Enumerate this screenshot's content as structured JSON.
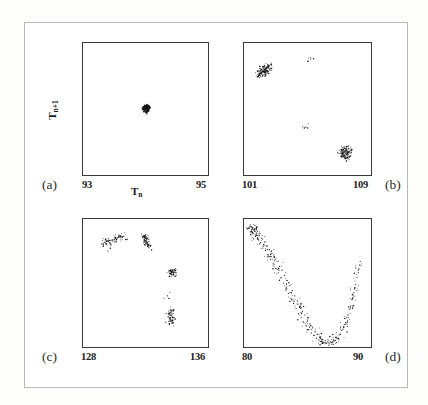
{
  "figure": {
    "title": "",
    "axis_titles": {
      "x": "T",
      "x_sub": "n",
      "y": "T",
      "y_sub": "n+1"
    }
  },
  "chart_data": [
    {
      "type": "scatter",
      "panel": "(a)",
      "title": "",
      "xlabel": "T_n",
      "ylabel": "T_n+1",
      "xlim": [
        93,
        95
      ],
      "ylim": [
        93,
        95
      ],
      "xticks": [
        "93",
        "95"
      ],
      "grid": false,
      "legend": "none",
      "annotation": "period-1 fixed point: single dense cluster",
      "points": [
        [
          94.02,
          94.0
        ],
        [
          94.0,
          94.03
        ],
        [
          94.03,
          94.01
        ],
        [
          93.99,
          93.98
        ],
        [
          94.01,
          94.04
        ],
        [
          94.04,
          94.02
        ],
        [
          93.98,
          94.01
        ],
        [
          94.02,
          93.97
        ],
        [
          94.05,
          94.03
        ],
        [
          93.97,
          94.0
        ],
        [
          94.0,
          94.05
        ],
        [
          94.03,
          93.99
        ],
        [
          93.99,
          94.02
        ],
        [
          94.06,
          94.01
        ],
        [
          94.01,
          93.96
        ],
        [
          93.96,
          93.99
        ],
        [
          94.04,
          94.06
        ],
        [
          94.02,
          94.02
        ],
        [
          94.0,
          93.99
        ],
        [
          94.01,
          94.01
        ],
        [
          94.03,
          94.04
        ],
        [
          93.98,
          93.97
        ],
        [
          94.05,
          93.98
        ],
        [
          93.97,
          94.04
        ],
        [
          94.02,
          94.05
        ],
        [
          94.0,
          94.0
        ],
        [
          94.04,
          93.97
        ],
        [
          93.99,
          94.05
        ],
        [
          94.01,
          94.0
        ],
        [
          94.03,
          94.02
        ],
        [
          94.06,
          94.04
        ],
        [
          93.95,
          94.01
        ],
        [
          94.02,
          93.95
        ],
        [
          94.0,
          94.02
        ],
        [
          94.01,
          94.03
        ],
        [
          94.04,
          94.0
        ],
        [
          93.98,
          94.03
        ],
        [
          94.03,
          93.96
        ],
        [
          94.05,
          94.05
        ],
        [
          93.99,
          93.96
        ],
        [
          94.07,
          94.02
        ],
        [
          93.96,
          94.03
        ],
        [
          94.02,
          94.07
        ],
        [
          94.01,
          93.94
        ],
        [
          94.0,
          94.01
        ]
      ]
    },
    {
      "type": "scatter",
      "panel": "(b)",
      "title": "",
      "xlabel": "T_n",
      "ylabel": "T_n+1",
      "xlim": [
        101,
        109
      ],
      "ylim": [
        101,
        109
      ],
      "xticks": [
        "101",
        "109"
      ],
      "grid": false,
      "legend": "none",
      "annotation": "period-2 orbit: two clusters, upper-left and lower-right",
      "points": [
        [
          102.1,
          107.2
        ],
        [
          102.2,
          107.3
        ],
        [
          102.3,
          107.4
        ],
        [
          102.0,
          107.1
        ],
        [
          102.4,
          107.5
        ],
        [
          102.5,
          107.5
        ],
        [
          102.15,
          107.25
        ],
        [
          102.25,
          107.35
        ],
        [
          102.35,
          107.45
        ],
        [
          101.95,
          107.05
        ],
        [
          102.45,
          107.55
        ],
        [
          102.05,
          107.15
        ],
        [
          102.6,
          107.6
        ],
        [
          101.9,
          107.0
        ],
        [
          102.55,
          107.5
        ],
        [
          102.3,
          107.2
        ],
        [
          102.1,
          107.4
        ],
        [
          102.4,
          107.3
        ],
        [
          102.2,
          107.5
        ],
        [
          102.5,
          107.3
        ],
        [
          102.0,
          107.45
        ],
        [
          102.35,
          107.1
        ],
        [
          102.7,
          107.7
        ],
        [
          101.85,
          106.95
        ],
        [
          102.25,
          107.55
        ],
        [
          102.15,
          107.0
        ],
        [
          102.45,
          107.2
        ],
        [
          102.05,
          107.35
        ],
        [
          102.55,
          107.65
        ],
        [
          102.3,
          107.6
        ],
        [
          107.3,
          102.4
        ],
        [
          107.4,
          102.3
        ],
        [
          107.2,
          102.5
        ],
        [
          107.5,
          102.2
        ],
        [
          107.35,
          102.45
        ],
        [
          107.25,
          102.35
        ],
        [
          107.45,
          102.25
        ],
        [
          107.15,
          102.55
        ],
        [
          107.55,
          102.15
        ],
        [
          107.3,
          102.2
        ],
        [
          107.4,
          102.6
        ],
        [
          107.2,
          102.3
        ],
        [
          107.5,
          102.5
        ],
        [
          107.6,
          102.4
        ],
        [
          107.1,
          102.4
        ],
        [
          107.35,
          102.6
        ],
        [
          107.45,
          102.5
        ],
        [
          107.25,
          102.15
        ],
        [
          107.55,
          102.35
        ],
        [
          107.3,
          102.7
        ],
        [
          107.4,
          102.1
        ],
        [
          107.2,
          102.65
        ],
        [
          107.5,
          102.05
        ],
        [
          107.65,
          102.45
        ],
        [
          107.05,
          102.3
        ],
        [
          107.35,
          102.05
        ],
        [
          107.15,
          102.2
        ],
        [
          107.6,
          102.6
        ],
        [
          107.45,
          102.7
        ],
        [
          107.25,
          102.45
        ],
        [
          105.2,
          108.1
        ],
        [
          104.9,
          103.9
        ]
      ]
    },
    {
      "type": "scatter",
      "panel": "(c)",
      "title": "",
      "xlabel": "T_n",
      "ylabel": "T_n+1",
      "xlim": [
        128,
        136
      ],
      "ylim": [
        128,
        136
      ],
      "xticks": [
        "128",
        "136"
      ],
      "grid": false,
      "legend": "none",
      "annotation": "period-4 orbit: four clusters arranged around an arc",
      "points": [
        [
          129.3,
          134.5
        ],
        [
          129.5,
          134.6
        ],
        [
          129.7,
          134.65
        ],
        [
          129.9,
          134.7
        ],
        [
          130.1,
          134.8
        ],
        [
          130.3,
          134.85
        ],
        [
          130.5,
          134.9
        ],
        [
          129.4,
          134.55
        ],
        [
          129.6,
          134.6
        ],
        [
          129.8,
          134.68
        ],
        [
          130.0,
          134.75
        ],
        [
          130.2,
          134.82
        ],
        [
          130.4,
          134.88
        ],
        [
          130.6,
          134.92
        ],
        [
          129.2,
          134.45
        ],
        [
          131.9,
          134.9
        ],
        [
          132.0,
          134.8
        ],
        [
          132.05,
          134.6
        ],
        [
          132.1,
          134.45
        ],
        [
          132.15,
          134.3
        ],
        [
          132.0,
          134.95
        ],
        [
          132.08,
          134.7
        ],
        [
          132.12,
          134.5
        ],
        [
          132.18,
          134.35
        ],
        [
          131.95,
          134.85
        ],
        [
          132.05,
          134.75
        ],
        [
          132.1,
          134.55
        ],
        [
          132.2,
          134.25
        ],
        [
          132.02,
          134.65
        ],
        [
          132.14,
          134.4
        ],
        [
          133.6,
          132.6
        ],
        [
          133.7,
          132.7
        ],
        [
          133.8,
          132.65
        ],
        [
          133.65,
          132.55
        ],
        [
          133.75,
          132.75
        ],
        [
          133.55,
          132.6
        ],
        [
          133.85,
          132.7
        ],
        [
          133.7,
          132.5
        ],
        [
          133.6,
          132.8
        ],
        [
          133.8,
          132.55
        ],
        [
          133.72,
          132.68
        ],
        [
          133.66,
          132.72
        ],
        [
          133.78,
          132.62
        ],
        [
          133.9,
          132.66
        ],
        [
          133.5,
          132.7
        ],
        [
          133.5,
          129.6
        ],
        [
          133.55,
          129.8
        ],
        [
          133.6,
          130.0
        ],
        [
          133.65,
          130.2
        ],
        [
          133.7,
          129.5
        ],
        [
          133.45,
          129.9
        ],
        [
          133.55,
          130.1
        ],
        [
          133.6,
          129.7
        ],
        [
          133.68,
          129.95
        ],
        [
          133.5,
          130.25
        ],
        [
          133.62,
          129.6
        ],
        [
          133.58,
          130.15
        ],
        [
          133.72,
          129.85
        ],
        [
          133.48,
          130.05
        ],
        [
          133.66,
          130.3
        ],
        [
          133.4,
          131.2
        ],
        [
          129.6,
          134.0
        ]
      ]
    },
    {
      "type": "scatter",
      "panel": "(d)",
      "title": "",
      "xlabel": "T_n",
      "ylabel": "T_n+1",
      "xlim": [
        80,
        90
      ],
      "ylim": [
        80,
        90
      ],
      "xticks": [
        "80",
        "90"
      ],
      "grid": false,
      "legend": "none",
      "annotation": "chaotic attractor: broad U-shaped (parabolic) band of points",
      "points": [
        [
          80.4,
          89.3
        ],
        [
          80.6,
          89.2
        ],
        [
          80.8,
          89.1
        ],
        [
          81.0,
          88.9
        ],
        [
          81.2,
          88.7
        ],
        [
          81.4,
          88.5
        ],
        [
          81.6,
          88.2
        ],
        [
          81.8,
          87.9
        ],
        [
          82.0,
          87.6
        ],
        [
          82.2,
          87.3
        ],
        [
          82.4,
          87.0
        ],
        [
          82.6,
          86.7
        ],
        [
          82.8,
          86.3
        ],
        [
          83.0,
          86.0
        ],
        [
          83.2,
          85.6
        ],
        [
          83.4,
          85.2
        ],
        [
          83.6,
          84.8
        ],
        [
          83.8,
          84.4
        ],
        [
          84.0,
          84.0
        ],
        [
          84.2,
          83.6
        ],
        [
          84.4,
          83.2
        ],
        [
          84.6,
          82.8
        ],
        [
          84.8,
          82.5
        ],
        [
          85.0,
          82.1
        ],
        [
          85.2,
          81.8
        ],
        [
          85.4,
          81.5
        ],
        [
          85.6,
          81.2
        ],
        [
          85.8,
          81.0
        ],
        [
          86.0,
          80.8
        ],
        [
          86.2,
          80.6
        ],
        [
          86.4,
          80.5
        ],
        [
          86.6,
          80.4
        ],
        [
          86.8,
          80.4
        ],
        [
          87.0,
          80.45
        ],
        [
          87.2,
          80.5
        ],
        [
          87.4,
          80.7
        ],
        [
          87.6,
          81.0
        ],
        [
          87.8,
          81.4
        ],
        [
          88.0,
          81.9
        ],
        [
          88.2,
          82.5
        ],
        [
          88.4,
          83.2
        ],
        [
          88.6,
          84.0
        ],
        [
          88.8,
          84.9
        ],
        [
          89.0,
          85.8
        ],
        [
          89.1,
          86.4
        ],
        [
          80.5,
          89.0
        ],
        [
          80.7,
          88.85
        ],
        [
          80.9,
          88.65
        ],
        [
          81.1,
          88.4
        ],
        [
          81.3,
          88.15
        ],
        [
          81.5,
          87.85
        ],
        [
          81.7,
          87.55
        ],
        [
          81.9,
          87.2
        ],
        [
          82.1,
          86.85
        ],
        [
          82.3,
          86.5
        ],
        [
          82.5,
          86.15
        ],
        [
          82.7,
          85.8
        ],
        [
          82.9,
          85.4
        ],
        [
          83.1,
          85.0
        ],
        [
          83.3,
          84.6
        ],
        [
          83.5,
          84.2
        ],
        [
          83.7,
          83.8
        ],
        [
          83.9,
          83.4
        ],
        [
          84.1,
          83.0
        ],
        [
          84.3,
          82.6
        ],
        [
          84.5,
          82.3
        ],
        [
          84.7,
          81.95
        ],
        [
          84.9,
          81.65
        ],
        [
          85.1,
          81.35
        ],
        [
          85.3,
          81.1
        ],
        [
          85.5,
          80.9
        ],
        [
          85.7,
          80.7
        ],
        [
          85.9,
          80.55
        ],
        [
          86.1,
          80.45
        ],
        [
          86.3,
          80.35
        ],
        [
          86.5,
          80.3
        ],
        [
          86.7,
          80.3
        ],
        [
          86.9,
          80.35
        ],
        [
          87.1,
          80.5
        ],
        [
          87.3,
          80.7
        ],
        [
          87.5,
          80.95
        ],
        [
          87.7,
          81.3
        ],
        [
          87.9,
          81.75
        ],
        [
          88.1,
          82.3
        ],
        [
          88.3,
          82.95
        ],
        [
          88.5,
          83.7
        ],
        [
          88.7,
          84.55
        ],
        [
          88.9,
          85.45
        ],
        [
          89.05,
          86.1
        ],
        [
          89.15,
          86.7
        ],
        [
          80.45,
          89.45
        ],
        [
          80.65,
          89.35
        ],
        [
          80.85,
          89.25
        ],
        [
          81.05,
          89.05
        ],
        [
          81.25,
          88.85
        ],
        [
          82.15,
          87.05
        ],
        [
          82.75,
          86.0
        ],
        [
          83.35,
          84.9
        ],
        [
          84.25,
          83.35
        ],
        [
          85.15,
          81.55
        ],
        [
          86.05,
          80.65
        ],
        [
          87.05,
          80.55
        ],
        [
          87.85,
          81.55
        ],
        [
          88.65,
          84.25
        ],
        [
          89.0,
          86.0
        ]
      ]
    }
  ],
  "panels": [
    {
      "id": "a",
      "tag": "(a)",
      "x_min_label": "93",
      "x_max_label": "95",
      "show_x_axis_title": true,
      "show_y_axis_title": true
    },
    {
      "id": "b",
      "tag": "(b)",
      "x_min_label": "101",
      "x_max_label": "109",
      "show_x_axis_title": false,
      "show_y_axis_title": false
    },
    {
      "id": "c",
      "tag": "(c)",
      "x_min_label": "128",
      "x_max_label": "136",
      "show_x_axis_title": false,
      "show_y_axis_title": false
    },
    {
      "id": "d",
      "tag": "(d)",
      "x_min_label": "80",
      "x_max_label": "90",
      "show_x_axis_title": false,
      "show_y_axis_title": false
    }
  ],
  "colors": {
    "point": "#141414",
    "frame": "#3a3a3a",
    "border": "#b9b9b9",
    "background": "#ffffff",
    "text": "#1a1a1a"
  }
}
